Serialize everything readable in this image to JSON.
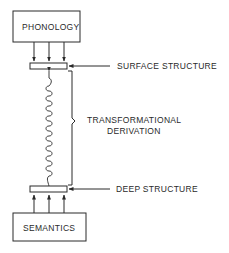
{
  "diagram": {
    "nodes": {
      "phonology": "PHONOLOGY",
      "semantics": "SEMANTICS"
    },
    "labels": {
      "surface_structure": "SURFACE STRUCTURE",
      "deep_structure": "DEEP STRUCTURE",
      "transformational_line1": "TRANSFORMATIONAL",
      "transformational_line2": "DERIVATION"
    },
    "colors": {
      "line": "#2a2a2a",
      "background": "#ffffff"
    }
  }
}
